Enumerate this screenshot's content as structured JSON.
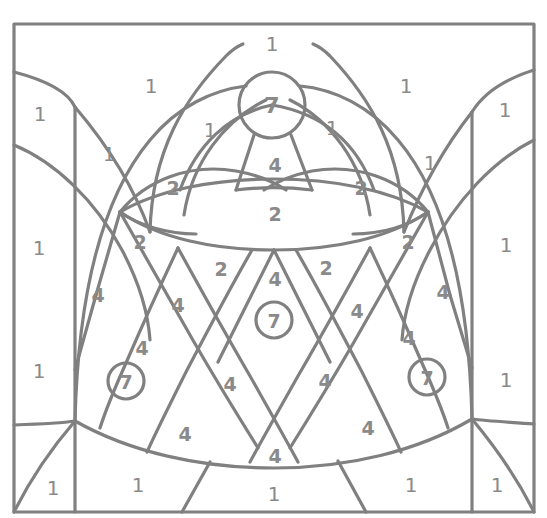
{
  "page": {
    "type": "color-by-number-line-art",
    "width": 547,
    "height": 518,
    "background_color": "#ffffff",
    "line_color": "#808080",
    "number_color": "#8a8a8a",
    "stroke_width": 3
  },
  "frame": {
    "left": 14,
    "top": 24,
    "right": 534,
    "bottom": 512
  },
  "legend_values": [
    "1",
    "2",
    "4",
    "7"
  ],
  "circled_marker_value": "7",
  "circles": [
    {
      "name": "top-center-circle",
      "cx": 272,
      "cy": 105,
      "r": 33,
      "label": "7"
    },
    {
      "name": "middle-center-circle",
      "cx": 274,
      "cy": 320,
      "r": 18,
      "label": "7"
    },
    {
      "name": "left-circle",
      "cx": 126,
      "cy": 381,
      "r": 18,
      "label": "7"
    },
    {
      "name": "right-circle",
      "cx": 427,
      "cy": 377,
      "r": 18,
      "label": "7"
    }
  ],
  "region_numbers": [
    {
      "id": "top-center-1",
      "value": "1",
      "x": 272,
      "y": 44
    },
    {
      "id": "top-left-petal-1",
      "value": "1",
      "x": 151,
      "y": 86
    },
    {
      "id": "top-right-petal-1",
      "value": "1",
      "x": 406,
      "y": 86
    },
    {
      "id": "outer-left-top-1",
      "value": "1",
      "x": 40,
      "y": 114
    },
    {
      "id": "outer-right-top-1",
      "value": "1",
      "x": 505,
      "y": 110
    },
    {
      "id": "inner-left-upper-1",
      "value": "1",
      "x": 210,
      "y": 130
    },
    {
      "id": "inner-right-upper-1",
      "value": "1",
      "x": 332,
      "y": 128
    },
    {
      "id": "mid-left-1",
      "value": "1",
      "x": 109,
      "y": 154
    },
    {
      "id": "mid-right-1",
      "value": "1",
      "x": 430,
      "y": 163
    },
    {
      "id": "outer-left-mid-1",
      "value": "1",
      "x": 39,
      "y": 248
    },
    {
      "id": "outer-right-mid-1",
      "value": "1",
      "x": 506,
      "y": 245
    },
    {
      "id": "outer-left-low-1",
      "value": "1",
      "x": 39,
      "y": 371
    },
    {
      "id": "outer-right-low-1",
      "value": "1",
      "x": 506,
      "y": 380
    },
    {
      "id": "bottom-left-1",
      "value": "1",
      "x": 53,
      "y": 488
    },
    {
      "id": "bottom-midleft-1",
      "value": "1",
      "x": 138,
      "y": 485
    },
    {
      "id": "bottom-center-1",
      "value": "1",
      "x": 274,
      "y": 494
    },
    {
      "id": "bottom-midright-1",
      "value": "1",
      "x": 411,
      "y": 485
    },
    {
      "id": "bottom-right-1",
      "value": "1",
      "x": 497,
      "y": 485
    },
    {
      "id": "left-leaf-2",
      "value": "2",
      "x": 173,
      "y": 188
    },
    {
      "id": "right-leaf-2",
      "value": "2",
      "x": 361,
      "y": 188
    },
    {
      "id": "center-leaf-2",
      "value": "2",
      "x": 275,
      "y": 214
    },
    {
      "id": "lattice-left-outer-2",
      "value": "2",
      "x": 140,
      "y": 242
    },
    {
      "id": "lattice-right-outer-2",
      "value": "2",
      "x": 408,
      "y": 242
    },
    {
      "id": "lattice-left-inner-2",
      "value": "2",
      "x": 221,
      "y": 269
    },
    {
      "id": "lattice-right-inner-2",
      "value": "2",
      "x": 326,
      "y": 268
    },
    {
      "id": "keystone-4",
      "value": "4",
      "x": 275,
      "y": 165
    },
    {
      "id": "center-top-4",
      "value": "4",
      "x": 275,
      "y": 279
    },
    {
      "id": "far-left-4",
      "value": "4",
      "x": 98,
      "y": 295
    },
    {
      "id": "far-right-4",
      "value": "4",
      "x": 443,
      "y": 292
    },
    {
      "id": "left-mid-4",
      "value": "4",
      "x": 178,
      "y": 305
    },
    {
      "id": "right-mid-4",
      "value": "4",
      "x": 357,
      "y": 311
    },
    {
      "id": "left-low-4",
      "value": "4",
      "x": 142,
      "y": 348
    },
    {
      "id": "right-low-4",
      "value": "4",
      "x": 409,
      "y": 338
    },
    {
      "id": "center-low-left-4",
      "value": "4",
      "x": 230,
      "y": 384
    },
    {
      "id": "center-low-right-4",
      "value": "4",
      "x": 325,
      "y": 381
    },
    {
      "id": "bottom-left-4",
      "value": "4",
      "x": 185,
      "y": 434
    },
    {
      "id": "bottom-right-4",
      "value": "4",
      "x": 368,
      "y": 428
    },
    {
      "id": "bottom-center-4",
      "value": "4",
      "x": 275,
      "y": 456
    }
  ]
}
